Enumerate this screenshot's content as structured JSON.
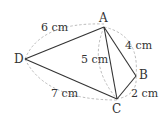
{
  "diagram": {
    "type": "quadrilateral-with-diagonal",
    "points": {
      "A": {
        "label": "A",
        "x": 104,
        "y": 27
      },
      "B": {
        "label": "B",
        "x": 136,
        "y": 76
      },
      "C": {
        "label": "C",
        "x": 117,
        "y": 99
      },
      "D": {
        "label": "D",
        "x": 25,
        "y": 59
      }
    },
    "edges": [
      {
        "from": "D",
        "to": "A",
        "length": "6 cm"
      },
      {
        "from": "A",
        "to": "B",
        "length": "4 cm"
      },
      {
        "from": "B",
        "to": "C",
        "length": "2 cm"
      },
      {
        "from": "D",
        "to": "C",
        "length": "7 cm"
      },
      {
        "from": "A",
        "to": "C",
        "length": "5 cm"
      }
    ],
    "colors": {
      "line": "#333333",
      "dashed_arc": "#aaaaaa",
      "text": "#333333"
    }
  }
}
